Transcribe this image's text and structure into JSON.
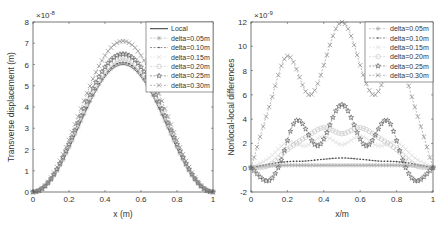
{
  "chart_data": [
    {
      "type": "line",
      "title": "",
      "xlabel": "x (m)",
      "ylabel": "Transverse displacement (m)",
      "y_exponent": "×10^-8",
      "xlim": [
        0,
        1
      ],
      "ylim": [
        0,
        8
      ],
      "xticks": [
        "0",
        "0.2",
        "0.4",
        "0.6",
        "0.8",
        "1"
      ],
      "yticks": [
        "0",
        "1",
        "2",
        "3",
        "4",
        "5",
        "6",
        "7",
        "8"
      ],
      "grid": false,
      "legend_position": "upper right",
      "series": [
        {
          "name": "Local",
          "marker": "none",
          "color": "#333333",
          "peak_value": 6.0,
          "peak_x": 0.5
        },
        {
          "name": "delta=0.05m",
          "marker": "asterisk",
          "color": "#aaaaaa",
          "peak_value": 6.05,
          "peak_x": 0.5
        },
        {
          "name": "delta=0.10m",
          "marker": "dot",
          "color": "#444444",
          "peak_value": 6.1,
          "peak_x": 0.5
        },
        {
          "name": "delta=0.15m",
          "marker": "x-light",
          "color": "#dddddd",
          "peak_value": 6.2,
          "peak_x": 0.5
        },
        {
          "name": "delta=0.20m",
          "marker": "circle",
          "color": "#c8c8c8",
          "peak_value": 6.3,
          "peak_x": 0.5
        },
        {
          "name": "delta=0.25m",
          "marker": "star",
          "color": "#666666",
          "peak_value": 6.5,
          "peak_x": 0.5
        },
        {
          "name": "delta=0.30m",
          "marker": "x",
          "color": "#888888",
          "peak_value": 7.1,
          "peak_x": 0.5
        }
      ]
    },
    {
      "type": "line",
      "title": "",
      "xlabel": "x/m",
      "ylabel": "Nonlocal-local differences",
      "y_exponent": "×10^-9",
      "xlim": [
        0,
        1
      ],
      "ylim": [
        -2,
        12
      ],
      "xticks": [
        "0",
        "0.2",
        "0.4",
        "0.6",
        "0.8",
        "1"
      ],
      "yticks": [
        "-2",
        "0",
        "2",
        "4",
        "6",
        "8",
        "10",
        "12"
      ],
      "grid": false,
      "legend_position": "upper right",
      "series": [
        {
          "name": "delta=0.05m",
          "marker": "asterisk",
          "color": "#aaaaaa",
          "x": [
            0,
            0.1,
            0.2,
            0.3,
            0.4,
            0.5,
            0.6,
            0.7,
            0.8,
            0.9,
            1
          ],
          "values": [
            0,
            0.15,
            0.2,
            0.2,
            0.2,
            0.2,
            0.2,
            0.2,
            0.2,
            0.15,
            0
          ]
        },
        {
          "name": "delta=0.10m",
          "marker": "dot",
          "color": "#444444",
          "x": [
            0,
            0.1,
            0.2,
            0.3,
            0.4,
            0.5,
            0.6,
            0.7,
            0.8,
            0.9,
            1
          ],
          "values": [
            0,
            0.3,
            0.5,
            0.55,
            0.7,
            0.8,
            0.7,
            0.55,
            0.5,
            0.3,
            0
          ]
        },
        {
          "name": "delta=0.15m",
          "marker": "x-light",
          "color": "#dddddd",
          "x": [
            0,
            0.1,
            0.2,
            0.3,
            0.4,
            0.5,
            0.6,
            0.7,
            0.8,
            0.9,
            1
          ],
          "values": [
            0,
            0.8,
            2.1,
            1.8,
            2.6,
            1.9,
            2.6,
            1.8,
            2.1,
            0.8,
            0
          ]
        },
        {
          "name": "delta=0.20m",
          "marker": "circle",
          "color": "#c8c8c8",
          "x": [
            0,
            0.1,
            0.2,
            0.3,
            0.4,
            0.5,
            0.6,
            0.7,
            0.8,
            0.9,
            1
          ],
          "values": [
            0,
            0.2,
            1.5,
            2.5,
            3.3,
            2.8,
            3.3,
            2.5,
            1.5,
            0.2,
            0
          ]
        },
        {
          "name": "delta=0.25m",
          "marker": "star",
          "color": "#666666",
          "x": [
            0,
            0.09,
            0.15,
            0.25,
            0.37,
            0.5,
            0.63,
            0.75,
            0.85,
            0.91,
            1
          ],
          "values": [
            0,
            -1.1,
            0,
            3.9,
            1.8,
            5.2,
            1.8,
            3.9,
            0,
            -1.1,
            0
          ]
        },
        {
          "name": "delta=0.30m",
          "marker": "x",
          "color": "#888888",
          "x": [
            0,
            0.1,
            0.2,
            0.33,
            0.5,
            0.67,
            0.8,
            0.9,
            1
          ],
          "values": [
            0,
            5.0,
            9.2,
            6.0,
            12.0,
            6.0,
            9.2,
            5.0,
            0
          ]
        }
      ]
    }
  ],
  "left_plot": {
    "exponent_base": "×10",
    "exponent_power": "-8",
    "xlabel": "x (m)",
    "ylabel": "Transverse displacement (m)",
    "xticks": [
      "0",
      "0.2",
      "0.4",
      "0.6",
      "0.8",
      "1"
    ],
    "yticks": [
      "0",
      "1",
      "2",
      "3",
      "4",
      "5",
      "6",
      "7",
      "8"
    ],
    "legend": [
      "Local",
      "delta=0.05m",
      "delta=0.10m",
      "delta=0.15m",
      "delta=0.20m",
      "delta=0.25m",
      "delta=0.30m"
    ]
  },
  "right_plot": {
    "exponent_base": "×10",
    "exponent_power": "-9",
    "xlabel": "x/m",
    "ylabel": "Nonlocal-local differences",
    "xticks": [
      "0",
      "0.2",
      "0.4",
      "0.6",
      "0.8",
      "1"
    ],
    "yticks": [
      "-2",
      "0",
      "2",
      "4",
      "6",
      "8",
      "10",
      "12"
    ],
    "legend": [
      "delta=0.05m",
      "delta=0.10m",
      "delta=0.15m",
      "delta=0.20m",
      "delta=0.25m",
      "delta=0.30m"
    ]
  }
}
